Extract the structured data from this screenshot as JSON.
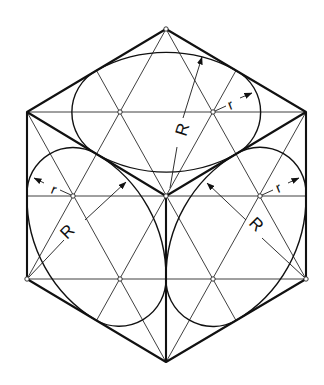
{
  "figure": {
    "labels": {
      "top_large_radius": "R",
      "top_small_radius": "r",
      "left_large_radius": "R",
      "left_small_radius": "r",
      "right_large_radius": "R",
      "right_small_radius": "r"
    },
    "colors": {
      "ink": "#111111",
      "background": "#ffffff"
    }
  }
}
